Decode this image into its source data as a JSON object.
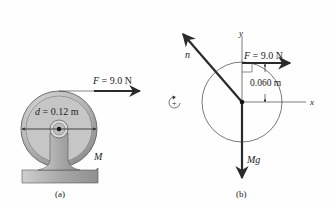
{
  "panel_a": {
    "caption": "(a)",
    "force_label": "F = 9.0 N",
    "diameter_label": "d = 0.12 m",
    "mass_label": "M"
  },
  "panel_b": {
    "caption": "(b)",
    "force_label": "F = 9.0 N",
    "radius_label": "0.060 m",
    "normal_label": "n",
    "weight_label": "Mg",
    "x_axis_label": "x",
    "y_axis_label": "y",
    "rotation_sign": "+"
  },
  "colors": {
    "line": "#2a2a2a",
    "wheel_outer": "#9a9a9a",
    "wheel_face": "#c4c4c4",
    "stand": "#a8a8a8",
    "circle": "#555555"
  }
}
